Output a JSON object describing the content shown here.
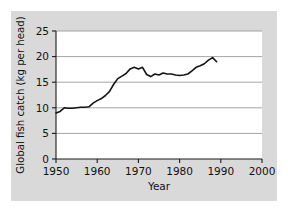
{
  "figure": {
    "panel_color": "#d9d9d9",
    "plot_color": "#ffffff",
    "line_color": "#141414",
    "grid_color": "#9a9a9a"
  },
  "chart_data": {
    "type": "line",
    "title": "",
    "xlabel": "Year",
    "ylabel": "Global fish catch (kg per head)",
    "xlim": [
      1950,
      2000
    ],
    "ylim": [
      0,
      25
    ],
    "xticks": [
      1950,
      1960,
      1970,
      1980,
      1990,
      2000
    ],
    "xtick_labels": [
      "1950",
      "1960",
      "1970",
      "1980",
      "1990",
      "2000"
    ],
    "yticks": [
      0,
      5,
      10,
      15,
      20,
      25
    ],
    "ytick_labels": [
      "0",
      "5",
      "10",
      "15",
      "20",
      "25"
    ],
    "grid": "horizontal",
    "legend": "none",
    "series": [
      {
        "name": "Global fish catch",
        "units": "kg per head",
        "x": [
          1950,
          1951,
          1952,
          1953,
          1954,
          1955,
          1956,
          1957,
          1958,
          1959,
          1960,
          1961,
          1962,
          1963,
          1964,
          1965,
          1966,
          1967,
          1968,
          1969,
          1970,
          1971,
          1972,
          1973,
          1974,
          1975,
          1976,
          1977,
          1978,
          1979,
          1980,
          1981,
          1982,
          1983,
          1984,
          1985,
          1986,
          1987,
          1988,
          1989
        ],
        "values": [
          9.0,
          9.3,
          10.0,
          9.9,
          9.9,
          10.0,
          10.1,
          10.1,
          10.2,
          10.9,
          11.4,
          11.8,
          12.4,
          13.2,
          14.6,
          15.7,
          16.2,
          16.7,
          17.6,
          17.9,
          17.6,
          17.9,
          16.5,
          16.1,
          16.6,
          16.4,
          16.8,
          16.6,
          16.6,
          16.4,
          16.3,
          16.4,
          16.6,
          17.2,
          17.9,
          18.2,
          18.6,
          19.3,
          19.8,
          19.0
        ]
      }
    ]
  }
}
